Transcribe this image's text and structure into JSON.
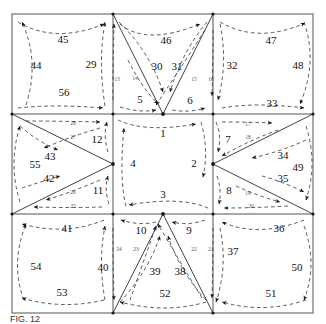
{
  "figure": {
    "type": "patent-diagram",
    "title": "",
    "caption": "FIG. 12",
    "frame": {
      "x": 12,
      "y": 14,
      "w": 301,
      "h": 299,
      "color": "#7a7a7a"
    },
    "grid": {
      "vertical_lines": [
        113,
        213
      ],
      "horizontal_lines": [
        114,
        214
      ],
      "line_color": "#8a8a8a"
    },
    "hubs": [
      {
        "name": "hub-top-center",
        "x": 163,
        "y": 114
      },
      {
        "name": "hub-mid-left",
        "x": 113,
        "y": 164
      },
      {
        "name": "hub-mid-right",
        "x": 213,
        "y": 164
      },
      {
        "name": "hub-bottom-center",
        "x": 163,
        "y": 214
      }
    ],
    "corners": [
      {
        "x": 12,
        "y": 14
      },
      {
        "x": 113,
        "y": 14
      },
      {
        "x": 213,
        "y": 14
      },
      {
        "x": 313,
        "y": 14
      },
      {
        "x": 12,
        "y": 114
      },
      {
        "x": 113,
        "y": 114
      },
      {
        "x": 213,
        "y": 114
      },
      {
        "x": 313,
        "y": 114
      },
      {
        "x": 12,
        "y": 214
      },
      {
        "x": 113,
        "y": 214
      },
      {
        "x": 213,
        "y": 214
      },
      {
        "x": 313,
        "y": 214
      },
      {
        "x": 12,
        "y": 313
      },
      {
        "x": 113,
        "y": 313
      },
      {
        "x": 213,
        "y": 313
      },
      {
        "x": 313,
        "y": 313
      }
    ],
    "labels_large": [
      {
        "id": "label-1",
        "text": "1",
        "x": 163,
        "y": 133
      },
      {
        "id": "label-2",
        "text": "2",
        "x": 194,
        "y": 163
      },
      {
        "id": "label-3",
        "text": "3",
        "x": 163,
        "y": 194
      },
      {
        "id": "label-4",
        "text": "4",
        "x": 133,
        "y": 163
      },
      {
        "id": "label-5",
        "text": "5",
        "x": 140,
        "y": 99
      },
      {
        "id": "label-6",
        "text": "6",
        "x": 190,
        "y": 100
      },
      {
        "id": "label-7",
        "text": "7",
        "x": 228,
        "y": 139
      },
      {
        "id": "label-8",
        "text": "8",
        "x": 229,
        "y": 190
      },
      {
        "id": "label-9",
        "text": "9",
        "x": 189,
        "y": 230
      },
      {
        "id": "label-10",
        "text": "10",
        "x": 141,
        "y": 230
      },
      {
        "id": "label-11",
        "text": "11",
        "x": 98,
        "y": 190
      },
      {
        "id": "label-12",
        "text": "12",
        "x": 97,
        "y": 139
      },
      {
        "id": "label-29",
        "text": "29",
        "x": 91,
        "y": 64
      },
      {
        "id": "label-30",
        "text": "30",
        "x": 157,
        "y": 66
      },
      {
        "id": "label-31",
        "text": "31",
        "x": 177,
        "y": 66
      },
      {
        "id": "label-32",
        "text": "32",
        "x": 232,
        "y": 65
      },
      {
        "id": "label-33",
        "text": "33",
        "x": 272,
        "y": 103
      },
      {
        "id": "label-34",
        "text": "34",
        "x": 283,
        "y": 155
      },
      {
        "id": "label-35",
        "text": "35",
        "x": 283,
        "y": 178
      },
      {
        "id": "label-36",
        "text": "36",
        "x": 279,
        "y": 228
      },
      {
        "id": "label-37",
        "text": "37",
        "x": 233,
        "y": 251
      },
      {
        "id": "label-38",
        "text": "38",
        "x": 180,
        "y": 271
      },
      {
        "id": "label-39",
        "text": "39",
        "x": 155,
        "y": 271
      },
      {
        "id": "label-40",
        "text": "40",
        "x": 103,
        "y": 267
      },
      {
        "id": "label-41",
        "text": "41",
        "x": 67,
        "y": 228
      },
      {
        "id": "label-42",
        "text": "42",
        "x": 49,
        "y": 178
      },
      {
        "id": "label-43",
        "text": "43",
        "x": 50,
        "y": 156
      },
      {
        "id": "label-44",
        "text": "44",
        "x": 36,
        "y": 65
      },
      {
        "id": "label-45",
        "text": "45",
        "x": 63,
        "y": 39
      },
      {
        "id": "label-46",
        "text": "46",
        "x": 166,
        "y": 40
      },
      {
        "id": "label-47",
        "text": "47",
        "x": 271,
        "y": 40
      },
      {
        "id": "label-48",
        "text": "48",
        "x": 298,
        "y": 65
      },
      {
        "id": "label-49",
        "text": "49",
        "x": 298,
        "y": 167
      },
      {
        "id": "label-50",
        "text": "50",
        "x": 297,
        "y": 267
      },
      {
        "id": "label-51",
        "text": "51",
        "x": 271,
        "y": 293
      },
      {
        "id": "label-52",
        "text": "52",
        "x": 165,
        "y": 293
      },
      {
        "id": "label-53",
        "text": "53",
        "x": 62,
        "y": 292
      },
      {
        "id": "label-54",
        "text": "54",
        "x": 36,
        "y": 266
      },
      {
        "id": "label-55",
        "text": "55",
        "x": 35,
        "y": 164
      },
      {
        "id": "label-56",
        "text": "56",
        "x": 64,
        "y": 92
      }
    ],
    "labels_small": [
      {
        "id": "label-13",
        "text": "13",
        "x": 117,
        "y": 79
      },
      {
        "id": "label-14",
        "text": "14",
        "x": 135,
        "y": 78
      },
      {
        "id": "label-15",
        "text": "15",
        "x": 194,
        "y": 79
      },
      {
        "id": "label-16",
        "text": "16",
        "x": 211,
        "y": 79
      },
      {
        "id": "label-17",
        "text": "17",
        "x": 248,
        "y": 124
      },
      {
        "id": "label-18",
        "text": "18",
        "x": 248,
        "y": 137
      },
      {
        "id": "label-19",
        "text": "19",
        "x": 248,
        "y": 193
      },
      {
        "id": "label-20",
        "text": "20",
        "x": 251,
        "y": 206
      },
      {
        "id": "label-21",
        "text": "21",
        "x": 211,
        "y": 249
      },
      {
        "id": "label-22",
        "text": "22",
        "x": 194,
        "y": 249
      },
      {
        "id": "label-23",
        "text": "23",
        "x": 136,
        "y": 249
      },
      {
        "id": "label-24",
        "text": "24",
        "x": 119,
        "y": 249
      },
      {
        "id": "label-25",
        "text": "25",
        "x": 73,
        "y": 206
      },
      {
        "id": "label-26",
        "text": "26",
        "x": 73,
        "y": 192
      },
      {
        "id": "label-27",
        "text": "27",
        "x": 73,
        "y": 137
      },
      {
        "id": "label-28",
        "text": "28",
        "x": 73,
        "y": 123
      }
    ]
  }
}
